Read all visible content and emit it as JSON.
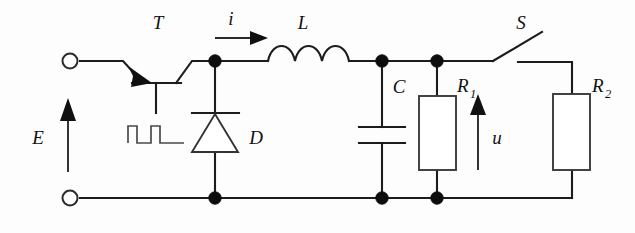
{
  "figure": {
    "background_color": "#fdfdfd",
    "line_color": "#1c1c1c",
    "width": 635,
    "height": 233
  },
  "labels": {
    "source": "E",
    "transistor": "T",
    "current": "i",
    "inductor": "L",
    "diode": "D",
    "capacitor": "C",
    "resistor1": "R",
    "resistor1_sub": "1",
    "voltage": "u",
    "switch": "S",
    "resistor2": "R",
    "resistor2_sub": "2"
  },
  "components": [
    {
      "id": "source-terminal-positive",
      "type": "terminal",
      "label": ""
    },
    {
      "id": "source-terminal-negative",
      "type": "terminal",
      "label": ""
    },
    {
      "id": "source-arrow",
      "type": "arrow",
      "label": "E",
      "direction": "up"
    },
    {
      "id": "transistor",
      "type": "bjt",
      "label": "T"
    },
    {
      "id": "gate-pulse",
      "type": "pulse-train",
      "label": ""
    },
    {
      "id": "diode",
      "type": "diode",
      "label": "D",
      "orientation": "cathode-up"
    },
    {
      "id": "current-arrow",
      "type": "arrow",
      "label": "i",
      "direction": "right"
    },
    {
      "id": "inductor",
      "type": "inductor",
      "label": "L",
      "coils": 3
    },
    {
      "id": "capacitor",
      "type": "capacitor",
      "label": "C"
    },
    {
      "id": "resistor-1",
      "type": "resistor",
      "label": "R1"
    },
    {
      "id": "voltage-arrow",
      "type": "arrow",
      "label": "u",
      "direction": "up"
    },
    {
      "id": "switch",
      "type": "switch",
      "label": "S",
      "state": "open"
    },
    {
      "id": "resistor-2",
      "type": "resistor",
      "label": "R2"
    }
  ],
  "nodes": [
    {
      "id": "node-diode-top",
      "x": 215,
      "y": 60
    },
    {
      "id": "node-cap-top",
      "x": 382,
      "y": 60
    },
    {
      "id": "node-r1-top",
      "x": 437,
      "y": 60
    },
    {
      "id": "node-diode-bottom",
      "x": 215,
      "y": 198
    },
    {
      "id": "node-cap-bottom",
      "x": 382,
      "y": 198
    },
    {
      "id": "node-r1-bottom",
      "x": 437,
      "y": 198
    }
  ]
}
